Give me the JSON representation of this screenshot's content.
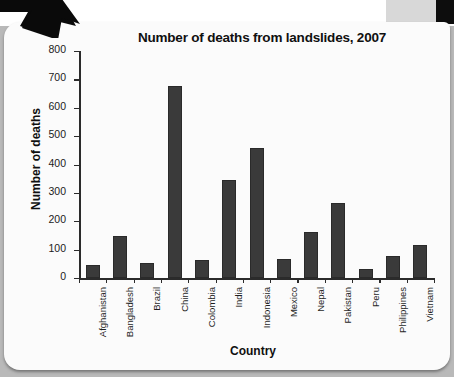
{
  "page": {
    "background_color": "#b9b9b9",
    "card_color": "#fbfbfb",
    "accent_color": "#3a3a3a",
    "arrow_icon": "arrow-down-right-icon"
  },
  "chart_data": {
    "type": "bar",
    "title": "Number of deaths from landslides, 2007",
    "xlabel": "Country",
    "ylabel": "Number of deaths",
    "categories": [
      "Afghanistan",
      "Bangladesh",
      "Brazil",
      "China",
      "Colombia",
      "India",
      "Indonesia",
      "Mexico",
      "Nepal",
      "Pakistan",
      "Peru",
      "Philippines",
      "Vietnam"
    ],
    "values": [
      46,
      148,
      53,
      675,
      65,
      345,
      458,
      67,
      162,
      264,
      31,
      78,
      118
    ],
    "ylim": [
      0,
      800
    ],
    "yticks": [
      0,
      100,
      200,
      300,
      400,
      500,
      600,
      700,
      800
    ],
    "ytick_labels": [
      "0",
      "100",
      "200",
      "300",
      "400",
      "500",
      "600",
      "700",
      "800"
    ],
    "grid": false,
    "legend": false,
    "bar_color": "#3a3a3a"
  }
}
